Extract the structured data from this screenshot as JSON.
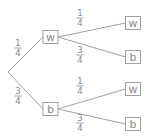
{
  "diagram": {
    "type": "probability-tree",
    "colors": {
      "line": "#a0a0a0",
      "text": "#888888"
    },
    "root": {
      "x": 8,
      "y": 72
    },
    "level1": [
      {
        "label": "w",
        "x": 50.5,
        "y": 37,
        "branch": {
          "num": "1",
          "den": "4",
          "lx": 18,
          "ly": 48
        }
      },
      {
        "label": "b",
        "x": 50.5,
        "y": 109,
        "branch": {
          "num": "3",
          "den": "4",
          "lx": 18,
          "ly": 96
        }
      }
    ],
    "level2": [
      {
        "parent": 0,
        "label": "w",
        "x": 133,
        "y": 23,
        "branch": {
          "num": "1",
          "den": "4",
          "lx": 80,
          "ly": 18
        }
      },
      {
        "parent": 0,
        "label": "b",
        "x": 133,
        "y": 57,
        "branch": {
          "num": "3",
          "den": "4",
          "lx": 80,
          "ly": 55
        }
      },
      {
        "parent": 1,
        "label": "w",
        "x": 133,
        "y": 89,
        "branch": {
          "num": "1",
          "den": "4",
          "lx": 80,
          "ly": 86
        }
      },
      {
        "parent": 1,
        "label": "b",
        "x": 133,
        "y": 124,
        "branch": {
          "num": "3",
          "den": "4",
          "lx": 80,
          "ly": 123
        }
      }
    ]
  }
}
